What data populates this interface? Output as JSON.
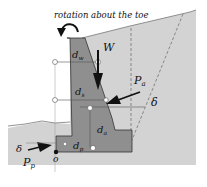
{
  "diagram": {
    "caption": "rotation about the toe",
    "labels": {
      "W": "W",
      "Pa": "P",
      "Pa_sub": "a",
      "Pp": "P",
      "Pp_sub": "p",
      "delta_active": "δ",
      "delta_passive": "δ",
      "dw": "d",
      "dw_sub": "w",
      "ds": "d",
      "ds_sub": "s",
      "da": "d",
      "da_sub": "a",
      "dp": "d",
      "dp_sub": "p",
      "toe": "o"
    },
    "colors": {
      "background_soil": "#d2d2d2",
      "wall": "#8e8e8e",
      "outline": "#333333",
      "white": "#ffffff"
    }
  }
}
